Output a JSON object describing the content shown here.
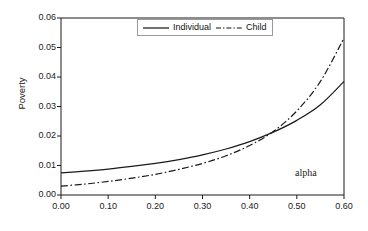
{
  "chart_data": {
    "type": "line",
    "title": "",
    "xlabel": "",
    "ylabel": "Poverty",
    "xlim": [
      0.0,
      0.6
    ],
    "ylim": [
      0.0,
      0.06
    ],
    "grid": false,
    "legend_position": "top-center",
    "annotation": "alpha",
    "xticks": [
      "0.00",
      "0.10",
      "0.20",
      "0.30",
      "0.40",
      "0.50",
      "0.60"
    ],
    "xtick_values": [
      0.0,
      0.1,
      0.2,
      0.3,
      0.4,
      0.5,
      0.6
    ],
    "yticks": [
      "0.00",
      "0.01",
      "0.02",
      "0.03",
      "0.04",
      "0.05",
      "0.06"
    ],
    "ytick_values": [
      0.0,
      0.01,
      0.02,
      0.03,
      0.04,
      0.05,
      0.06
    ],
    "x": [
      0.0,
      0.05,
      0.1,
      0.15,
      0.2,
      0.25,
      0.3,
      0.35,
      0.4,
      0.45,
      0.5,
      0.55,
      0.6
    ],
    "series": [
      {
        "name": "Individual",
        "style": "solid",
        "color": "#1a1a1a",
        "values": [
          0.0075,
          0.0081,
          0.0088,
          0.0097,
          0.0107,
          0.012,
          0.0136,
          0.0156,
          0.0181,
          0.0213,
          0.0253,
          0.0306,
          0.0385
        ]
      },
      {
        "name": "Child",
        "style": "dash-dot",
        "color": "#1a1a1a",
        "values": [
          0.003,
          0.0037,
          0.0046,
          0.0057,
          0.007,
          0.0087,
          0.0107,
          0.0133,
          0.0168,
          0.0215,
          0.0285,
          0.0385,
          0.0532
        ]
      }
    ]
  },
  "legend": {
    "entries": [
      {
        "label": "Individual",
        "style": "solid"
      },
      {
        "label": "Child",
        "style": "dash-dot"
      }
    ]
  },
  "axes": {
    "y_title": "Poverty"
  },
  "annotations": {
    "alpha": "alpha"
  }
}
